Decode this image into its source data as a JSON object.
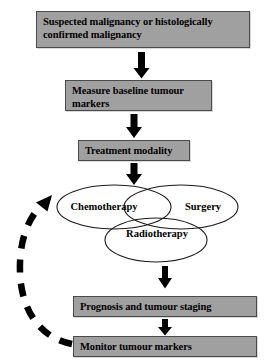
{
  "diagram": {
    "colors": {
      "box_fill": "#a0a0a0",
      "box_border": "#4a4a4a",
      "text": "#000000",
      "arrow": "#000000",
      "ellipse_stroke": "#1a1a1a",
      "background": "#ffffff"
    },
    "boxes": [
      {
        "id": "suspected",
        "label": "Suspected malignancy or histologically confirmed malignancy"
      },
      {
        "id": "measure",
        "label": "Measure baseline tumour markers"
      },
      {
        "id": "treatment",
        "label": "Treatment modality"
      },
      {
        "id": "prognosis",
        "label": "Prognosis and tumour staging"
      },
      {
        "id": "monitor",
        "label": "Monitor tumour markers"
      }
    ],
    "venn": {
      "chemotherapy": "Chemotherapy",
      "surgery": "Surgery",
      "radiotherapy": "Radiotherapy"
    },
    "arrows": [
      {
        "id": "arrow-suspected-to-measure",
        "type": "solid-down"
      },
      {
        "id": "arrow-measure-to-treatment",
        "type": "solid-down"
      },
      {
        "id": "arrow-treatment-to-venn",
        "type": "solid-down"
      },
      {
        "id": "arrow-venn-to-prognosis",
        "type": "solid-down"
      },
      {
        "id": "arrow-prognosis-to-monitor",
        "type": "solid-down"
      },
      {
        "id": "arrow-monitor-to-venn-feedback",
        "type": "dashed-curved-feedback"
      }
    ]
  }
}
